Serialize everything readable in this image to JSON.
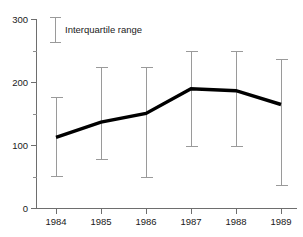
{
  "chart_data": {
    "type": "line",
    "title": "",
    "xlabel": "",
    "ylabel": "",
    "categories": [
      "1984",
      "1985",
      "1986",
      "1987",
      "1988",
      "1989"
    ],
    "x_tick_labels": [
      "1984",
      "1985",
      "1986",
      "1987",
      "1988",
      "1989"
    ],
    "y_tick_labels": [
      "0",
      "100",
      "200",
      "300"
    ],
    "y_ticks": [
      0,
      100,
      200,
      300
    ],
    "y_minor_ticks": [
      50,
      150,
      250
    ],
    "ylim": [
      0,
      300
    ],
    "grid": false,
    "legend_position": "top-left",
    "series": [
      {
        "name": "Median",
        "values": [
          113,
          137,
          151,
          190,
          187,
          165
        ]
      }
    ],
    "error_bars": {
      "name": "Interquartile range",
      "lower": [
        52,
        78,
        50,
        100,
        100,
        38
      ],
      "upper": [
        177,
        225,
        225,
        250,
        250,
        237
      ]
    },
    "annotations": []
  },
  "legend": {
    "label": "Interquartile range"
  },
  "colors": {
    "median_line": "#000000",
    "iqr_bar": "#9a9a9a",
    "axis": "#6e6e6e",
    "text": "#1a1a1a",
    "background": "#ffffff"
  },
  "axis": {
    "y_tick_0": "0",
    "y_tick_100": "100",
    "y_tick_200": "200",
    "y_tick_300": "300"
  }
}
